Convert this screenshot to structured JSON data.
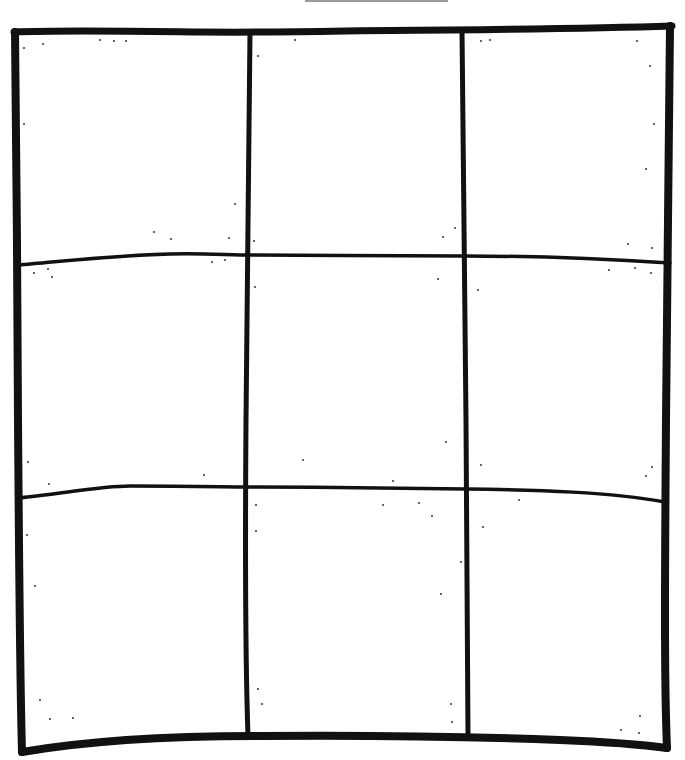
{
  "diagram": {
    "title": "",
    "type": "hand-drawn 3x3 grid",
    "rows": 3,
    "columns": 3,
    "stroke_color": "#111111",
    "background_color": "#ffffff",
    "top_mark_color": "#9a9a9a",
    "cells": [
      {
        "row": 1,
        "col": 1,
        "label": ""
      },
      {
        "row": 1,
        "col": 2,
        "label": ""
      },
      {
        "row": 1,
        "col": 3,
        "label": ""
      },
      {
        "row": 2,
        "col": 1,
        "label": ""
      },
      {
        "row": 2,
        "col": 2,
        "label": ""
      },
      {
        "row": 2,
        "col": 3,
        "label": ""
      },
      {
        "row": 3,
        "col": 1,
        "label": ""
      },
      {
        "row": 3,
        "col": 2,
        "label": ""
      },
      {
        "row": 3,
        "col": 3,
        "label": ""
      }
    ]
  }
}
